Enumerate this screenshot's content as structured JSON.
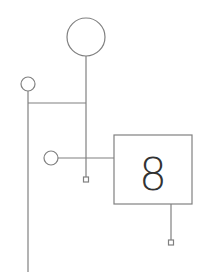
{
  "diagram": {
    "box_label": "8",
    "colors": {
      "stroke": "#808080",
      "text": "#333333",
      "background": "#ffffff"
    }
  }
}
